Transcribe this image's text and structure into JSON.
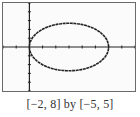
{
  "chart_data": {
    "type": "line",
    "title": "",
    "xlabel": "",
    "ylabel": "",
    "xlim": [
      -2,
      8
    ],
    "ylim": [
      -5,
      5
    ],
    "x_tick_step": 1,
    "y_tick_step": 1,
    "grid": false,
    "legend": null,
    "series": [
      {
        "name": "ellipse",
        "description": "Ellipse centered near (3, 0), horizontal semi-axis ~3, vertical semi-axis ~2.7; drawn with graphing-calculator pixel style, small gaps in lower-left and lower-right",
        "center": [
          3,
          0
        ],
        "semi_axis_x": 3,
        "semi_axis_y": 2.7
      }
    ],
    "caption": "[−2, 8] by [−5, 5]"
  },
  "colors": {
    "axis": "#222222",
    "curve": "#222222",
    "frame": "#6a6a6a"
  }
}
